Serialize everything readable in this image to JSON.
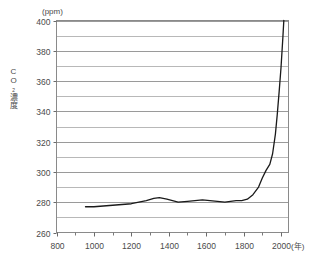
{
  "chart_data": {
    "type": "line",
    "title": "",
    "subtitle": "",
    "xlabel": "(年)",
    "ylabel": "CO₂濃度",
    "yunit": "(ppm)",
    "ylim": [
      260,
      400
    ],
    "xlim": [
      800,
      2040
    ],
    "grid": true,
    "grid_major_step": 20,
    "grid_minor_step": 10,
    "legend": "none",
    "y_ticks": [
      400,
      380,
      360,
      340,
      320,
      300,
      280,
      260
    ],
    "y_tick_labels": [
      "400",
      "380",
      "360",
      "340",
      "320",
      "300",
      "280",
      "260"
    ],
    "x_ticks": [
      800,
      1000,
      1200,
      1400,
      1600,
      1800,
      2000
    ],
    "x_tick_labels": [
      "800",
      "1000",
      "1200",
      "1400",
      "1600",
      "1800",
      "2000"
    ],
    "x_minor_ticks": [
      900,
      1100,
      1300,
      1500,
      1700,
      1900
    ],
    "series": [
      {
        "name": "CO2 concentration",
        "color": "#1a1a1a",
        "x": [
          955,
          1000,
          1050,
          1100,
          1150,
          1200,
          1240,
          1280,
          1320,
          1350,
          1390,
          1420,
          1450,
          1500,
          1540,
          1580,
          1620,
          1660,
          1700,
          1730,
          1760,
          1790,
          1820,
          1850,
          1880,
          1900,
          1920,
          1940,
          1955,
          1970,
          1980,
          1990,
          2000,
          2010,
          2015
        ],
        "y": [
          277,
          277,
          277.5,
          278,
          278.5,
          279,
          280,
          281,
          282.5,
          283,
          282,
          281,
          280,
          280.5,
          281,
          281.5,
          281,
          280.5,
          280,
          280.5,
          281,
          281,
          282,
          285,
          290,
          296,
          301,
          305,
          312,
          325,
          338,
          353,
          369,
          389,
          400
        ]
      }
    ],
    "axis_title_vertical_chars": [
      "C",
      "O",
      "₂",
      "濃",
      "度"
    ]
  }
}
